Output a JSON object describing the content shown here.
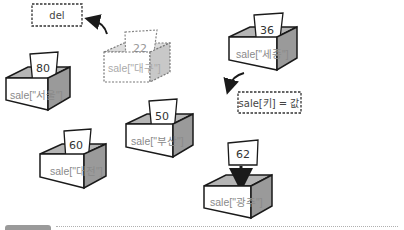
{
  "diagram": {
    "colors": {
      "outline": "#1a1a1a",
      "side_shade": "#9a9a9a",
      "inner_shade": "#b5b5b5",
      "front": "#ffffff",
      "faded_outline": "#777777",
      "label_text": "#8a8a8a"
    },
    "boxes": [
      {
        "id": "seoul",
        "label": "sale[\"서울\"]",
        "value": "80",
        "style": "solid"
      },
      {
        "id": "daegu",
        "label": "sale[\"대구\"]",
        "value": "22",
        "style": "dashed"
      },
      {
        "id": "sejong",
        "label": "sale[\"세종\"]",
        "value": "36",
        "style": "solid"
      },
      {
        "id": "busan",
        "label": "sale[\"부산\"]",
        "value": "50",
        "style": "solid"
      },
      {
        "id": "daejeon",
        "label": "sale[\"대전\"]",
        "value": "60",
        "style": "solid"
      },
      {
        "id": "gwangju",
        "label": "sale[\"광주\"]",
        "value": "62",
        "style": "solid",
        "card_dropping": true
      }
    ],
    "annotations": {
      "delete_label": "del",
      "assign_label": "sale[키] = 값"
    }
  }
}
